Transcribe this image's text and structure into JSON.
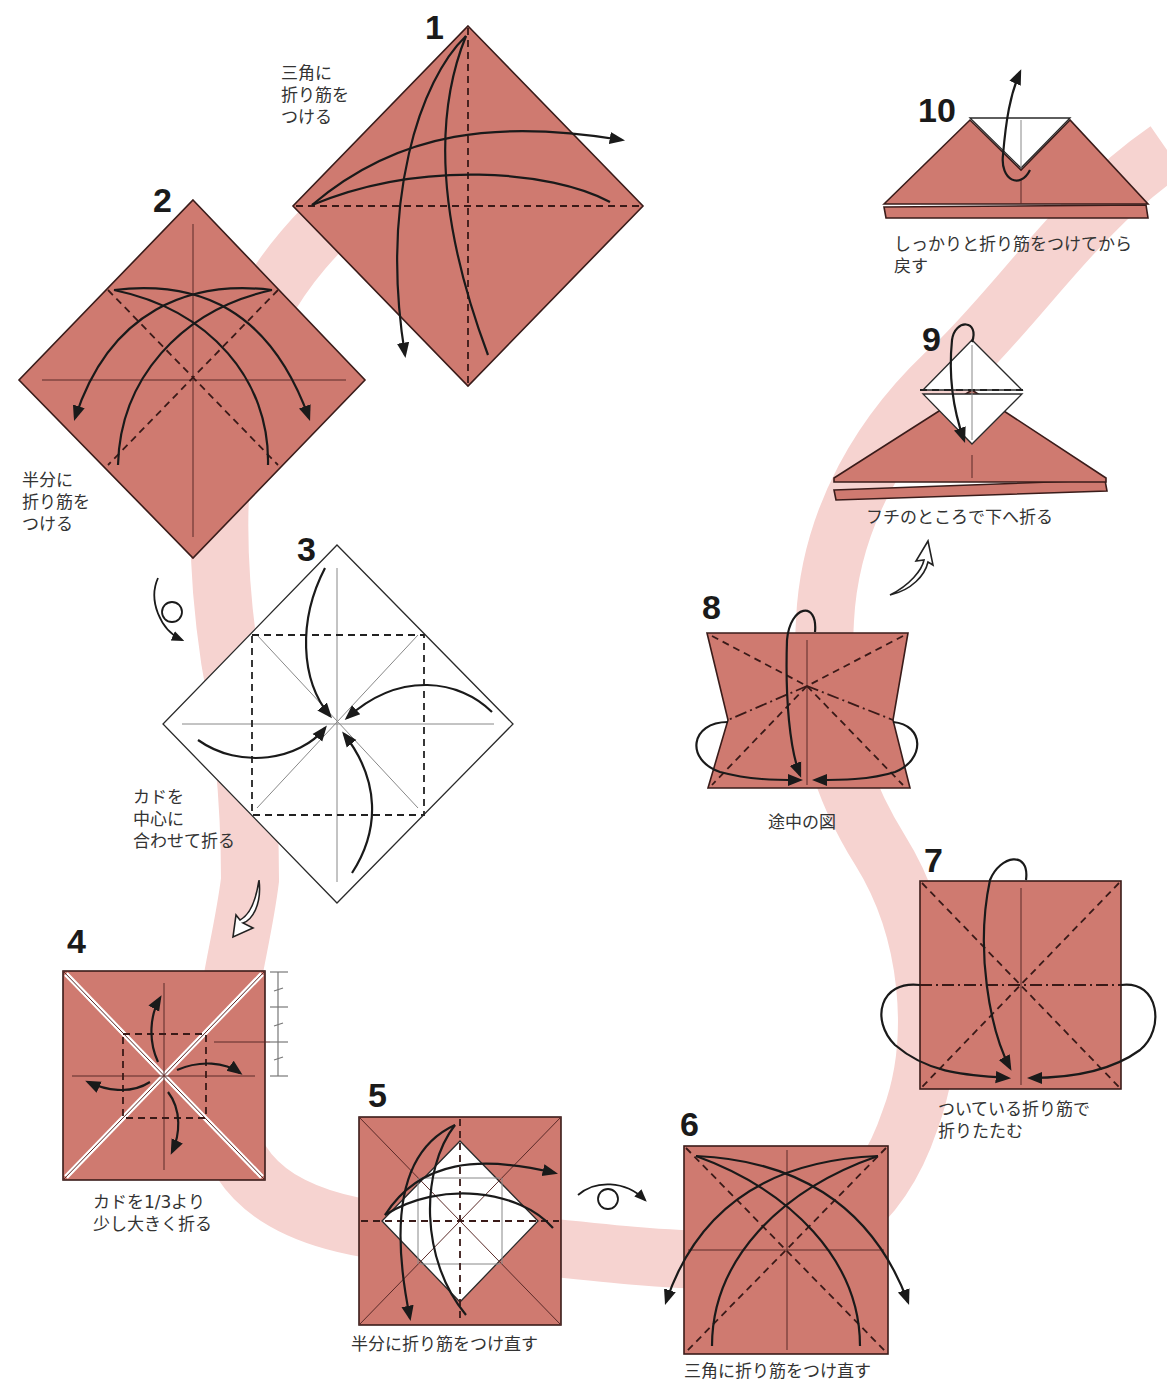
{
  "diagram": {
    "type": "origami-instructions",
    "colors": {
      "paper": "#cf7a70",
      "paper_back": "#ffffff",
      "path_ribbon": "#f6d3d0",
      "lines": "#1a1a1a"
    },
    "steps": [
      {
        "number": "1",
        "caption": "三角に\n折り筋を\nつける"
      },
      {
        "number": "2",
        "caption": "半分に\n折り筋を\nつける"
      },
      {
        "number": "3",
        "caption": "カドを\n中心に\n合わせて折る"
      },
      {
        "number": "4",
        "caption": "カドを1/3より\n少し大きく折る"
      },
      {
        "number": "5",
        "caption": "半分に折り筋をつけ直す"
      },
      {
        "number": "6",
        "caption": "三角に折り筋をつけ直す"
      },
      {
        "number": "7",
        "caption": "ついている折り筋で\n折りたたむ"
      },
      {
        "number": "8",
        "caption": "途中の図"
      },
      {
        "number": "9",
        "caption": "フチのところで下へ折る"
      },
      {
        "number": "10",
        "caption": "しっかりと折り筋をつけてから\n戻す"
      }
    ],
    "symbols": [
      {
        "name": "turn-over-icon",
        "between": "2-3"
      },
      {
        "name": "next-step-arrow-icon",
        "between": "3-4"
      },
      {
        "name": "turn-over-icon",
        "between": "5-6"
      },
      {
        "name": "next-step-arrow-icon",
        "between": "8-9"
      },
      {
        "name": "thirds-ruler",
        "step": "4"
      }
    ]
  }
}
